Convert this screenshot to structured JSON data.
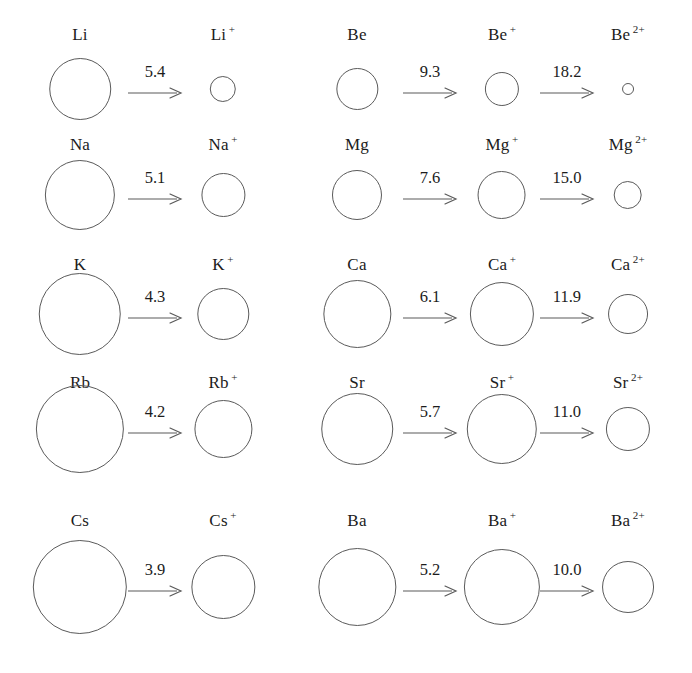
{
  "figure": {
    "title": "",
    "units": "eV"
  },
  "chart_data": {
    "type": "diagram",
    "title": "",
    "xlabel": "",
    "ylabel": "",
    "value_units": "eV",
    "groups": [
      {
        "name": "group-1",
        "rows": [
          {
            "element": "Li",
            "species": [
              {
                "symbol": "Li",
                "charge": "",
                "radius_px": 31
              },
              {
                "symbol": "Li",
                "charge": "+",
                "radius_px": 13
              }
            ],
            "steps": [
              {
                "value": "5.4"
              }
            ]
          },
          {
            "element": "Na",
            "species": [
              {
                "symbol": "Na",
                "charge": "",
                "radius_px": 35
              },
              {
                "symbol": "Na",
                "charge": "+",
                "radius_px": 22
              }
            ],
            "steps": [
              {
                "value": "5.1"
              }
            ]
          },
          {
            "element": "K",
            "species": [
              {
                "symbol": "K",
                "charge": "",
                "radius_px": 41
              },
              {
                "symbol": "K",
                "charge": "+",
                "radius_px": 26
              }
            ],
            "steps": [
              {
                "value": "4.3"
              }
            ]
          },
          {
            "element": "Rb",
            "species": [
              {
                "symbol": "Rb",
                "charge": "",
                "radius_px": 44
              },
              {
                "symbol": "Rb",
                "charge": "+",
                "radius_px": 29
              }
            ],
            "steps": [
              {
                "value": "4.2"
              }
            ]
          },
          {
            "element": "Cs",
            "species": [
              {
                "symbol": "Cs",
                "charge": "",
                "radius_px": 47
              },
              {
                "symbol": "Cs",
                "charge": "+",
                "radius_px": 32
              }
            ],
            "steps": [
              {
                "value": "3.9"
              }
            ]
          }
        ]
      },
      {
        "name": "group-2",
        "rows": [
          {
            "element": "Be",
            "species": [
              {
                "symbol": "Be",
                "charge": "",
                "radius_px": 21
              },
              {
                "symbol": "Be",
                "charge": "+",
                "radius_px": 17
              },
              {
                "symbol": "Be",
                "charge": "2+",
                "radius_px": 6
              }
            ],
            "steps": [
              {
                "value": "9.3"
              },
              {
                "value": "18.2"
              }
            ]
          },
          {
            "element": "Mg",
            "species": [
              {
                "symbol": "Mg",
                "charge": "",
                "radius_px": 25
              },
              {
                "symbol": "Mg",
                "charge": "+",
                "radius_px": 24
              },
              {
                "symbol": "Mg",
                "charge": "2+",
                "radius_px": 14
              }
            ],
            "steps": [
              {
                "value": "7.6"
              },
              {
                "value": "15.0"
              }
            ]
          },
          {
            "element": "Ca",
            "species": [
              {
                "symbol": "Ca",
                "charge": "",
                "radius_px": 34
              },
              {
                "symbol": "Ca",
                "charge": "+",
                "radius_px": 32
              },
              {
                "symbol": "Ca",
                "charge": "2+",
                "radius_px": 20
              }
            ],
            "steps": [
              {
                "value": "6.1"
              },
              {
                "value": "11.9"
              }
            ]
          },
          {
            "element": "Sr",
            "species": [
              {
                "symbol": "Sr",
                "charge": "",
                "radius_px": 36
              },
              {
                "symbol": "Sr",
                "charge": "+",
                "radius_px": 35
              },
              {
                "symbol": "Sr",
                "charge": "2+",
                "radius_px": 22
              }
            ],
            "steps": [
              {
                "value": "5.7"
              },
              {
                "value": "11.0"
              }
            ]
          },
          {
            "element": "Ba",
            "species": [
              {
                "symbol": "Ba",
                "charge": "",
                "radius_px": 39
              },
              {
                "symbol": "Ba",
                "charge": "+",
                "radius_px": 38
              },
              {
                "symbol": "Ba",
                "charge": "2+",
                "radius_px": 26
              }
            ],
            "steps": [
              {
                "value": "5.2"
              },
              {
                "value": "10.0"
              }
            ]
          }
        ]
      }
    ]
  },
  "colors": {
    "background": "#ffffff",
    "stroke": "#5a5a5a",
    "text": "#1c1c1c"
  },
  "layout": {
    "column_centers_group1": [
      80,
      223
    ],
    "column_centers_group2": [
      357,
      502,
      628
    ],
    "arrow_centers_group1": [
      155
    ],
    "arrow_centers_group2": [
      430,
      567
    ],
    "row_label_tops": [
      26,
      136,
      256,
      374,
      512
    ],
    "row_circle_centers_y": [
      90,
      196,
      315,
      430,
      588
    ]
  }
}
